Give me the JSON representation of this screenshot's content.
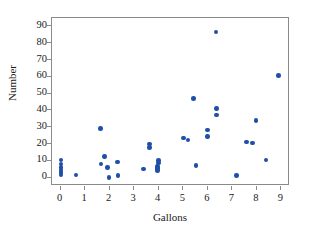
{
  "chart_data": {
    "type": "scatter",
    "title": "",
    "xlabel": "Gallons",
    "ylabel": "Number",
    "xlim": [
      -0.35,
      9.35
    ],
    "ylim": [
      -5,
      95
    ],
    "grid": false,
    "legend": "none",
    "marker_color": "#1f4fa6",
    "frame_color": "#8a8a8a",
    "xticks": [
      0,
      1,
      2,
      3,
      4,
      5,
      6,
      7,
      8,
      9
    ],
    "xtick_labels": [
      "0",
      "1",
      "2",
      "3",
      "4",
      "5",
      "6",
      "7",
      "8",
      "9"
    ],
    "yticks": [
      0,
      10,
      20,
      30,
      40,
      50,
      60,
      70,
      80,
      90
    ],
    "ytick_labels": [
      "0",
      "10",
      "20",
      "30",
      "40",
      "50",
      "60",
      "70",
      "80",
      "90"
    ],
    "series": [
      {
        "name": "observations",
        "points": [
          [
            0.02,
            10.5
          ],
          [
            0.02,
            8.0
          ],
          [
            0.02,
            6.0
          ],
          [
            0.02,
            4.5
          ],
          [
            0.02,
            3.0
          ],
          [
            0.02,
            1.5
          ],
          [
            0.62,
            1.5
          ],
          [
            1.62,
            29.3
          ],
          [
            1.64,
            8.0
          ],
          [
            1.8,
            12.6
          ],
          [
            1.9,
            6.0
          ],
          [
            1.98,
            0.2
          ],
          [
            2.32,
            9.3
          ],
          [
            2.34,
            1.3
          ],
          [
            3.38,
            5.2
          ],
          [
            3.62,
            20.0
          ],
          [
            3.62,
            18.0
          ],
          [
            3.98,
            10.3
          ],
          [
            3.98,
            8.8
          ],
          [
            3.96,
            6.7
          ],
          [
            3.96,
            5.4
          ],
          [
            3.94,
            4.2
          ],
          [
            5.0,
            23.6
          ],
          [
            5.2,
            22.5
          ],
          [
            5.42,
            47.0
          ],
          [
            5.52,
            7.2
          ],
          [
            5.98,
            28.3
          ],
          [
            5.98,
            24.4
          ],
          [
            6.34,
            86.6
          ],
          [
            6.36,
            41.2
          ],
          [
            6.36,
            37.2
          ],
          [
            7.18,
            1.4
          ],
          [
            7.58,
            21.2
          ],
          [
            7.82,
            20.5
          ],
          [
            7.96,
            34.0
          ],
          [
            8.38,
            10.5
          ],
          [
            8.88,
            60.7
          ]
        ]
      }
    ]
  }
}
